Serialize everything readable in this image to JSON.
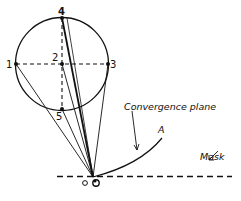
{
  "diagram": {
    "points": [
      {
        "id": "1",
        "label": "1"
      },
      {
        "id": "2",
        "label": "2"
      },
      {
        "id": "3",
        "label": "3"
      },
      {
        "id": "4",
        "label": "4"
      },
      {
        "id": "5",
        "label": "5"
      }
    ],
    "origin_label": "O",
    "curve_label": "A",
    "convergence_label": "Convergence plane",
    "mask_label": "Mask",
    "stroke_color": "#111111",
    "background": "#ffffff"
  }
}
